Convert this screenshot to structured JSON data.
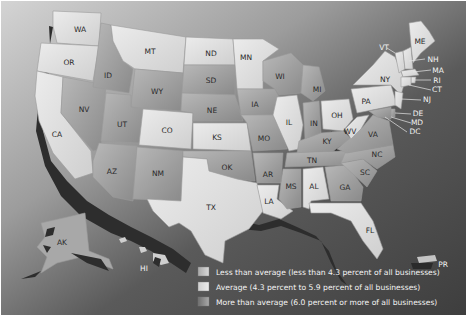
{
  "map": {
    "title": "",
    "background_color": "#4e4e4e",
    "shadow_color": "#2b2b2b",
    "states": [
      {
        "abbr": "WA",
        "category": "low"
      },
      {
        "abbr": "OR",
        "category": "low"
      },
      {
        "abbr": "CA",
        "category": "low"
      },
      {
        "abbr": "NV",
        "category": "high"
      },
      {
        "abbr": "ID",
        "category": "high"
      },
      {
        "abbr": "MT",
        "category": "low"
      },
      {
        "abbr": "WY",
        "category": "high"
      },
      {
        "abbr": "UT",
        "category": "high"
      },
      {
        "abbr": "AZ",
        "category": "high"
      },
      {
        "abbr": "CO",
        "category": "low"
      },
      {
        "abbr": "NM",
        "category": "high"
      },
      {
        "abbr": "ND",
        "category": "low"
      },
      {
        "abbr": "SD",
        "category": "high"
      },
      {
        "abbr": "NE",
        "category": "high"
      },
      {
        "abbr": "KS",
        "category": "low"
      },
      {
        "abbr": "OK",
        "category": "high"
      },
      {
        "abbr": "TX",
        "category": "low"
      },
      {
        "abbr": "MN",
        "category": "low"
      },
      {
        "abbr": "IA",
        "category": "high"
      },
      {
        "abbr": "MO",
        "category": "high"
      },
      {
        "abbr": "AR",
        "category": "high"
      },
      {
        "abbr": "LA",
        "category": "low"
      },
      {
        "abbr": "WI",
        "category": "high"
      },
      {
        "abbr": "IL",
        "category": "low"
      },
      {
        "abbr": "MI",
        "category": "high"
      },
      {
        "abbr": "IN",
        "category": "high"
      },
      {
        "abbr": "OH",
        "category": "low"
      },
      {
        "abbr": "KY",
        "category": "high"
      },
      {
        "abbr": "TN",
        "category": "high"
      },
      {
        "abbr": "MS",
        "category": "high"
      },
      {
        "abbr": "AL",
        "category": "low"
      },
      {
        "abbr": "GA",
        "category": "high"
      },
      {
        "abbr": "FL",
        "category": "low"
      },
      {
        "abbr": "SC",
        "category": "high"
      },
      {
        "abbr": "NC",
        "category": "high"
      },
      {
        "abbr": "VA",
        "category": "high"
      },
      {
        "abbr": "WV",
        "category": "low"
      },
      {
        "abbr": "PA",
        "category": "low"
      },
      {
        "abbr": "NY",
        "category": "low"
      },
      {
        "abbr": "VT",
        "category": "low"
      },
      {
        "abbr": "NH",
        "category": "low"
      },
      {
        "abbr": "ME",
        "category": "low"
      },
      {
        "abbr": "MA",
        "category": "low"
      },
      {
        "abbr": "RI",
        "category": "low"
      },
      {
        "abbr": "CT",
        "category": "low"
      },
      {
        "abbr": "NJ",
        "category": "low"
      },
      {
        "abbr": "DE",
        "category": "high"
      },
      {
        "abbr": "MD",
        "category": "high"
      },
      {
        "abbr": "DC",
        "category": "high"
      },
      {
        "abbr": "AK",
        "category": "high"
      },
      {
        "abbr": "HI",
        "category": "low"
      },
      {
        "abbr": "PR",
        "category": "low"
      }
    ],
    "labels": {
      "WA": "WA",
      "OR": "OR",
      "CA": "CA",
      "NV": "NV",
      "ID": "ID",
      "MT": "MT",
      "WY": "WY",
      "UT": "UT",
      "AZ": "AZ",
      "CO": "CO",
      "NM": "NM",
      "ND": "ND",
      "SD": "SD",
      "NE": "NE",
      "KS": "KS",
      "OK": "OK",
      "TX": "TX",
      "MN": "MN",
      "IA": "IA",
      "MO": "MO",
      "AR": "AR",
      "LA": "LA",
      "WI": "WI",
      "IL": "IL",
      "MI": "MI",
      "IN": "IN",
      "OH": "OH",
      "KY": "KY",
      "TN": "TN",
      "MS": "MS",
      "AL": "AL",
      "GA": "GA",
      "FL": "FL",
      "SC": "SC",
      "NC": "NC",
      "VA": "VA",
      "WV": "WV",
      "PA": "PA",
      "NY": "NY",
      "VT": "VT",
      "NH": "NH",
      "ME": "ME",
      "MA": "MA",
      "RI": "RI",
      "CT": "CT",
      "NJ": "NJ",
      "DE": "DE",
      "MD": "MD",
      "DC": "DC",
      "AK": "AK",
      "HI": "HI",
      "PR": "PR"
    }
  },
  "legend": {
    "items": [
      {
        "key": "low",
        "label": "Less than average (less than 4.3 percent of all businesses)",
        "color": "#c4c4c4"
      },
      {
        "key": "avg",
        "label": "Average (4.3 percent to 5.9 percent of all businesses)",
        "color": "#dadada"
      },
      {
        "key": "high",
        "label": "More than average (6.0 percent or more of all businesses)",
        "color": "#8c8c8c"
      }
    ]
  },
  "colors": {
    "low": "#d6d6d6",
    "high": "#9a9a9a",
    "low_alt": "#e4e4e4",
    "ocean": "#4e4e4e",
    "land_bg": "#d0d0d0"
  }
}
